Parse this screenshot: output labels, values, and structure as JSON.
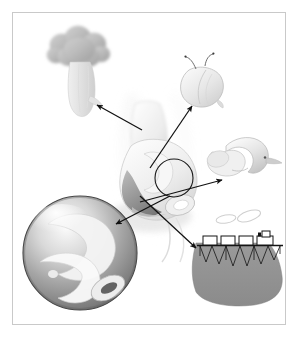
{
  "figure": {
    "title": "Exploded anatomical illustration with magnified detail callouts",
    "caption": "",
    "style": "grayscale airbrush scientific illustration",
    "background_color": "#ffffff",
    "frame": {
      "border_color": "#c9c9c9",
      "border_width_px": 1,
      "x": 12,
      "y": 12,
      "width": 274,
      "height": 313
    },
    "palette": {
      "ink": "#111111",
      "outline": "#8f8f8f",
      "light_gray": "#ededed",
      "mid_gray": "#c4c4c4",
      "dark_gray": "#8a8a8a",
      "deep_gray": "#6e6e6e",
      "shadow": "#d8d8d8",
      "highlight": "#fbfbfb"
    },
    "parts": [
      {
        "id": "central-body",
        "name": "central-organ",
        "label": "",
        "description": "Large central soft-tissue form with scroll-like folds and a dark lower lobe",
        "cx": 148,
        "cy": 175
      },
      {
        "id": "magnifier-circle",
        "name": "magnification-circle",
        "label": "",
        "description": "Small circle marking the magnified region on the central organ",
        "cx": 174,
        "cy": 178,
        "r": 19
      },
      {
        "id": "detail-broccoli",
        "name": "detail-broccoli-structure",
        "label": "",
        "description": "Lobed cauliflower-like body on a tapering stalk, upper left",
        "cx": 78,
        "cy": 62
      },
      {
        "id": "detail-seed",
        "name": "detail-seed-body",
        "label": "",
        "description": "Rounded seed or pod shape with two thin filaments, upper right",
        "cx": 205,
        "cy": 85
      },
      {
        "id": "detail-hook",
        "name": "detail-hooked-organelle",
        "label": "",
        "description": "Curved hook or saddle shaped body with small tail, right",
        "cx": 243,
        "cy": 160
      },
      {
        "id": "detail-train",
        "name": "detail-train-on-trestle",
        "label": "",
        "description": "Locomotive with three cars on a latticed trestle above a dark mound, with smoke puffs",
        "cx": 240,
        "cy": 262
      },
      {
        "id": "detail-sphere",
        "name": "detail-magnified-sphere",
        "label": "",
        "description": "Large glossy sphere containing curved folded forms, lower left",
        "cx": 80,
        "cy": 253,
        "r": 57
      }
    ],
    "arrows": [
      {
        "id": "arrow-1",
        "name": "arrow-to-broccoli",
        "from": [
          142,
          130
        ],
        "to": [
          97,
          105
        ],
        "label": ""
      },
      {
        "id": "arrow-2",
        "name": "arrow-to-seed",
        "from": [
          150,
          168
        ],
        "to": [
          192,
          106
        ],
        "label": ""
      },
      {
        "id": "arrow-3",
        "name": "arrow-to-hook",
        "from": [
          140,
          202
        ],
        "to": [
          222,
          180
        ],
        "label": ""
      },
      {
        "id": "arrow-4",
        "name": "arrow-to-train",
        "from": [
          140,
          196
        ],
        "to": [
          196,
          248
        ],
        "label": ""
      },
      {
        "id": "arrow-5",
        "name": "arrow-to-sphere",
        "from": [
          170,
          196
        ],
        "to": [
          116,
          224
        ],
        "label": ""
      }
    ],
    "smoke_puffs": [
      {
        "cx": 226,
        "cy": 219,
        "rx": 10,
        "ry": 4,
        "rot": -10
      },
      {
        "cx": 249,
        "cy": 216,
        "rx": 12,
        "ry": 5,
        "rot": -18
      }
    ],
    "train_cars": [
      {
        "x": 208,
        "y": 236,
        "w": 13,
        "h": 9,
        "type": "car"
      },
      {
        "x": 224,
        "y": 236,
        "w": 13,
        "h": 9,
        "type": "car"
      },
      {
        "x": 240,
        "y": 236,
        "w": 13,
        "h": 9,
        "type": "car"
      },
      {
        "x": 256,
        "y": 233,
        "w": 14,
        "h": 12,
        "type": "locomotive"
      }
    ]
  }
}
